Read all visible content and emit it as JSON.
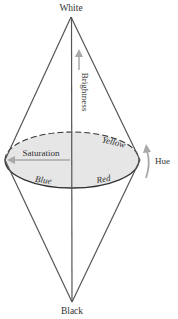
{
  "diagram": {
    "labels": {
      "top": "White",
      "bottom": "Black",
      "axis": "Brightness",
      "radius": "Saturation",
      "rotation": "Hue",
      "color_yellow": "Yellow",
      "color_blue": "Blue",
      "color_red": "Red"
    },
    "colors": {
      "lines": "#555555",
      "ellipse_fill": "#e6e6e6",
      "arrow": "#a8a8a8",
      "text": "#333333"
    }
  }
}
